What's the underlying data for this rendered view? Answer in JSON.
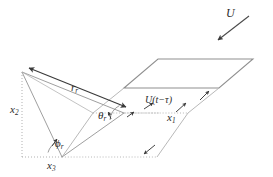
{
  "figure": {
    "colors": {
      "line_dark": "#3a3a3a",
      "line_gray": "#8c8c8c",
      "line_light": "#b4b4b4",
      "dotted": "#a8a8a8",
      "text": "#2b2b2b",
      "background": "#ffffff"
    },
    "labels": {
      "velocity": "U",
      "retarded_velocity_base": "U",
      "retarded_velocity_arg": "(t−τ)",
      "axis_1": "x",
      "axis_1_sub": "1",
      "axis_2": "x",
      "axis_2_sub": "2",
      "axis_3": "x",
      "axis_3_sub": "3",
      "radius": "r",
      "radius_sub": "r",
      "theta": "θ",
      "theta_sub": "r",
      "phi": "ϕ",
      "phi_sub": "r"
    }
  }
}
